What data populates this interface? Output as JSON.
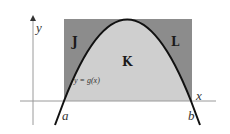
{
  "diagram": {
    "colors": {
      "background": "#ffffff",
      "outer_region": "#8c8c8c",
      "inner_region": "#cfcfcf",
      "curve": "#111111",
      "axes": "#9a9a9a"
    },
    "axes": {
      "x_label": "x",
      "y_label": "y"
    },
    "curve": {
      "label": "y = g(x)"
    },
    "regions": {
      "left": "J",
      "middle": "K",
      "right": "L"
    },
    "points": {
      "a": "a",
      "b": "b"
    }
  }
}
